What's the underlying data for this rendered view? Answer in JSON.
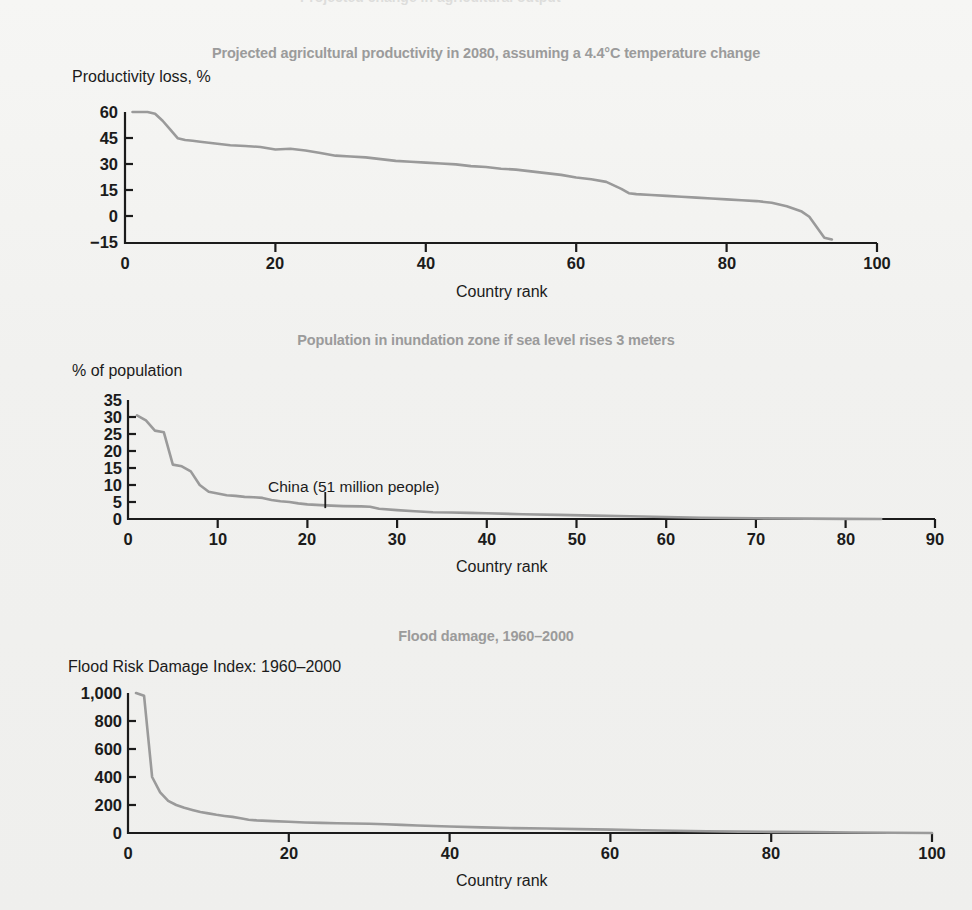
{
  "page": {
    "background_color": "#f1f1ef",
    "title_color": "#9b9b9b",
    "line_color": "#9a9a9a",
    "axis_color": "#1b1b1b",
    "top_bleed_text": "Projected change in agricultural output"
  },
  "charts": [
    {
      "id": "agricultural-productivity",
      "title": "Projected agricultural productivity in 2080, assuming a 4.4°C temperature change",
      "ylabel": "Productivity loss, %",
      "xlabel": "Country rank",
      "yticks": [
        "60",
        "45",
        "30",
        "15",
        "0",
        "−15"
      ],
      "xticks": [
        "0",
        "20",
        "40",
        "60",
        "80",
        "100"
      ]
    },
    {
      "id": "inundation-zone-population",
      "title": "Population in inundation zone if sea level rises 3 meters",
      "ylabel": "% of population",
      "xlabel": "Country rank",
      "yticks": [
        "35",
        "30",
        "25",
        "20",
        "15",
        "10",
        "5",
        "0"
      ],
      "xticks": [
        "0",
        "10",
        "20",
        "30",
        "40",
        "50",
        "60",
        "70",
        "80",
        "90"
      ],
      "annotation": "China (51 million people)"
    },
    {
      "id": "flood-damage",
      "title": "Flood damage, 1960–2000",
      "ylabel": "Flood Risk Damage Index: 1960–2000",
      "xlabel": "Country rank",
      "yticks": [
        "1,000",
        "800",
        "600",
        "400",
        "200",
        "0"
      ],
      "xticks": [
        "0",
        "20",
        "40",
        "60",
        "80",
        "100"
      ]
    }
  ],
  "chart_data": [
    {
      "type": "line",
      "title": "Projected agricultural productivity in 2080, assuming a 4.4°C temperature change",
      "xlabel": "Country rank",
      "ylabel": "Productivity loss, %",
      "xlim": [
        0,
        100
      ],
      "ylim": [
        -15,
        60
      ],
      "yticks": [
        -15,
        0,
        15,
        30,
        45,
        60
      ],
      "xticks": [
        0,
        20,
        40,
        60,
        80,
        100
      ],
      "grid": false,
      "legend": "none",
      "x": [
        1,
        2,
        3,
        4,
        5,
        6,
        7,
        8,
        9,
        10,
        12,
        14,
        16,
        18,
        20,
        22,
        24,
        26,
        28,
        30,
        32,
        34,
        36,
        38,
        40,
        42,
        44,
        46,
        48,
        50,
        52,
        54,
        56,
        58,
        60,
        62,
        64,
        66,
        67,
        68,
        70,
        72,
        74,
        76,
        78,
        80,
        82,
        84,
        86,
        88,
        90,
        91,
        92,
        93,
        94
      ],
      "y": [
        60,
        60,
        60,
        59,
        55,
        50,
        45,
        44,
        43.5,
        43,
        42,
        41,
        40.5,
        40,
        38.5,
        39,
        38,
        36.5,
        35,
        34.5,
        34,
        33,
        32,
        31.5,
        31,
        30.5,
        30,
        29,
        28.5,
        27.5,
        27,
        26,
        25,
        24,
        22.5,
        21.5,
        20,
        16,
        13.5,
        13,
        12.5,
        12,
        11.5,
        11,
        10.5,
        10,
        9.5,
        9,
        8,
        6,
        3,
        0,
        -6,
        -12,
        -13
      ]
    },
    {
      "type": "line",
      "title": "Population in inundation zone if sea level rises 3 meters",
      "xlabel": "Country rank",
      "ylabel": "% of population",
      "xlim": [
        0,
        90
      ],
      "ylim": [
        0,
        35
      ],
      "yticks": [
        0,
        5,
        10,
        15,
        20,
        25,
        30,
        35
      ],
      "xticks": [
        0,
        10,
        20,
        30,
        40,
        50,
        60,
        70,
        80,
        90
      ],
      "grid": false,
      "legend": "none",
      "annotations": [
        {
          "text": "China (51 million people)",
          "x": 22,
          "y": 3.2
        }
      ],
      "x": [
        1,
        2,
        3,
        4,
        5,
        6,
        7,
        8,
        9,
        10,
        11,
        12,
        13,
        14,
        15,
        16,
        17,
        18,
        19,
        20,
        22,
        24,
        26,
        27,
        28,
        30,
        32,
        34,
        36,
        38,
        40,
        44,
        48,
        52,
        56,
        60,
        64,
        70,
        76,
        80,
        84
      ],
      "y": [
        30.5,
        29,
        26,
        25.5,
        16,
        15.5,
        14,
        10,
        8,
        7.5,
        7,
        6.8,
        6.5,
        6.4,
        6.2,
        5.6,
        5.2,
        5.0,
        4.6,
        4.3,
        4.0,
        3.8,
        3.7,
        3.6,
        3.0,
        2.6,
        2.3,
        2.0,
        1.9,
        1.8,
        1.7,
        1.4,
        1.2,
        1.0,
        0.8,
        0.6,
        0.35,
        0.2,
        0.1,
        0.05,
        0.0
      ]
    },
    {
      "type": "line",
      "title": "Flood damage, 1960–2000",
      "xlabel": "Country rank",
      "ylabel": "Flood Risk Damage Index: 1960–2000",
      "xlim": [
        0,
        100
      ],
      "ylim": [
        0,
        1000
      ],
      "yticks": [
        0,
        200,
        400,
        600,
        800,
        1000
      ],
      "xticks": [
        0,
        20,
        40,
        60,
        80,
        100
      ],
      "grid": false,
      "legend": "none",
      "x": [
        1,
        2,
        3,
        4,
        5,
        6,
        7,
        8,
        9,
        10,
        11,
        12,
        13,
        14,
        15,
        16,
        18,
        20,
        22,
        24,
        26,
        28,
        30,
        32,
        34,
        36,
        38,
        40,
        44,
        48,
        52,
        56,
        60,
        64,
        68,
        72,
        76,
        80,
        85,
        90,
        95,
        100
      ],
      "y": [
        1000,
        980,
        400,
        290,
        230,
        200,
        180,
        165,
        150,
        140,
        130,
        122,
        115,
        105,
        95,
        90,
        85,
        80,
        75,
        72,
        70,
        68,
        66,
        62,
        58,
        54,
        50,
        46,
        40,
        35,
        32,
        28,
        24,
        20,
        16,
        13,
        10,
        8,
        6,
        4,
        2,
        0
      ]
    }
  ]
}
